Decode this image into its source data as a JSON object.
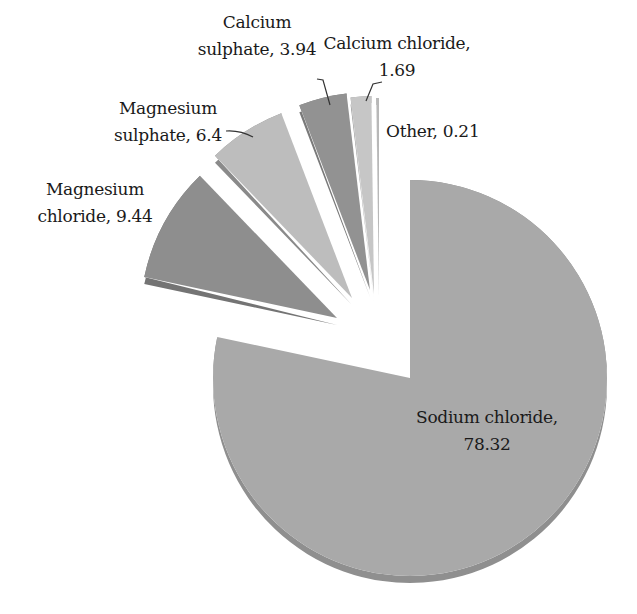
{
  "chart_data": {
    "type": "pie",
    "title": "",
    "style": "3d-exploded",
    "start_angle_deg": 0,
    "direction": "clockwise",
    "slices": [
      {
        "name": "Sodium chloride",
        "value": 78.32,
        "color": "#a9a9a9",
        "side_color": "#8f8f8f",
        "explode": [
          0,
          0
        ]
      },
      {
        "name": "Magnesium chloride",
        "value": 9.44,
        "color": "#8e8e8e",
        "side_color": "#747474",
        "explode": [
          -73,
          -60
        ]
      },
      {
        "name": "Magnesium sulphate",
        "value": 6.4,
        "color": "#bdbdbd",
        "side_color": "#8a8a8a",
        "explode": [
          -58,
          -80
        ]
      },
      {
        "name": "Calcium sulphate",
        "value": 3.94,
        "color": "#929292",
        "side_color": "#7a7a7a",
        "explode": [
          -40,
          -88
        ]
      },
      {
        "name": "Calcium chloride",
        "value": 1.69,
        "color": "#c6c6c6",
        "side_color": "#9a9a9a",
        "explode": [
          -36,
          -84
        ]
      },
      {
        "name": "Other",
        "value": 0.21,
        "color": "#b8b8b8",
        "side_color": "#8a8a8a",
        "explode": [
          -31,
          -82
        ]
      }
    ],
    "legend": "none",
    "data_labels": "category, value"
  },
  "labels": {
    "sodium_chloride": {
      "line1": "Sodium chloride,",
      "line2": "78.32"
    },
    "magnesium_chloride": {
      "line1": "Magnesium",
      "line2": "chloride, 9.44"
    },
    "magnesium_sulphate": {
      "line1": "Magnesium",
      "line2": "sulphate, 6.4"
    },
    "calcium_sulphate": {
      "line1": "Calcium",
      "line2": "sulphate, 3.94"
    },
    "calcium_chloride": {
      "line1": "Calcium chloride,",
      "line2": "1.69"
    },
    "other": {
      "line1": "Other, 0.21"
    }
  }
}
